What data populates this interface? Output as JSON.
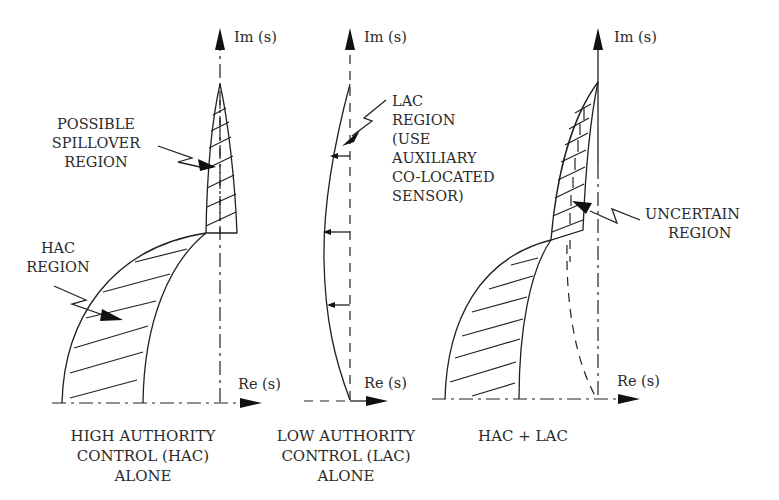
{
  "figure": {
    "panels": [
      {
        "id": "hac",
        "axis_im": "Im (s)",
        "axis_re": "Re (s)",
        "caption": [
          "HIGH AUTHORITY",
          "CONTROL (HAC)",
          "ALONE"
        ],
        "callouts": [
          {
            "name": "possible-spillover-region",
            "lines": [
              "POSSIBLE",
              "SPILLOVER",
              "REGION"
            ]
          },
          {
            "name": "hac-region",
            "lines": [
              "HAC",
              "REGION"
            ]
          }
        ]
      },
      {
        "id": "lac",
        "axis_im": "Im (s)",
        "axis_re": "Re (s)",
        "caption": [
          "LOW AUTHORITY",
          "CONTROL (LAC)",
          "ALONE"
        ],
        "callouts": [
          {
            "name": "lac-region",
            "lines": [
              "LAC",
              "REGION",
              "(USE",
              "AUXILIARY",
              "CO-LOCATED",
              "SENSOR)"
            ]
          }
        ]
      },
      {
        "id": "hac-lac",
        "axis_im": "Im (s)",
        "axis_re": "Re (s)",
        "caption": [
          "HAC + LAC"
        ],
        "callouts": [
          {
            "name": "uncertain-region",
            "lines": [
              "UNCERTAIN",
              "REGION"
            ]
          }
        ]
      }
    ]
  }
}
